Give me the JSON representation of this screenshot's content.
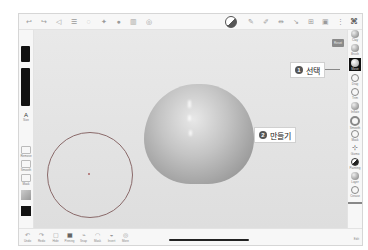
{
  "app": {
    "name": "3D sculpting app"
  },
  "topbar": {
    "left_icons": [
      "undo-icon",
      "redo-icon",
      "scene-icon",
      "settings-icon",
      "material-icon",
      "light-icon",
      "camera-icon",
      "layers-icon",
      "topology-icon"
    ],
    "right_icons": [
      "shading-icon",
      "pen-icon",
      "pen-alt-icon",
      "symmetry-icon",
      "vertex-icon",
      "grid-icon",
      "wireframe-icon",
      "more-icon",
      "close-icon"
    ],
    "close_glyph": "⌘"
  },
  "left_panel": {
    "items": [
      {
        "label": "Size"
      },
      {
        "label": "Remove"
      },
      {
        "label": "Smooth"
      },
      {
        "label": "Mask"
      }
    ]
  },
  "right_panel": {
    "tools": [
      {
        "label": "Clay"
      },
      {
        "label": "Brush"
      },
      {
        "label": "Move",
        "selected": true
      },
      {
        "label": "Drag"
      },
      {
        "label": "Trim"
      },
      {
        "label": "Inflate"
      },
      {
        "label": "Smooth"
      },
      {
        "label": "Mask"
      },
      {
        "label": "Gizmo"
      },
      {
        "label": "Painting"
      },
      {
        "label": "Layer"
      },
      {
        "label": "Crease"
      }
    ],
    "corner_label": "Edit"
  },
  "canvas": {
    "top_button_label": "Reset"
  },
  "bottombar": {
    "items": [
      {
        "label": "Undo",
        "glyph": "↶"
      },
      {
        "label": "Redo",
        "glyph": "↷"
      },
      {
        "label": "Hide",
        "glyph": "▢"
      },
      {
        "label": "Pinning",
        "glyph": "▦"
      },
      {
        "label": "Snap",
        "glyph": "⌁"
      },
      {
        "label": "Mask",
        "glyph": "◠"
      },
      {
        "label": "Invert",
        "glyph": "◒"
      },
      {
        "label": "More",
        "glyph": "◎"
      }
    ],
    "corner_label": "Edit"
  },
  "callouts": [
    {
      "number": "1",
      "text": "선택"
    },
    {
      "number": "2",
      "text": "만들기"
    }
  ]
}
